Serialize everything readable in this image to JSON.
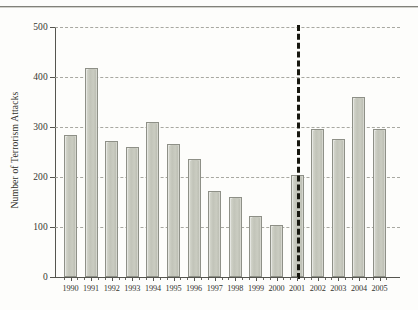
{
  "figure": {
    "background_color": "#fdfdfb",
    "has_top_rule": true,
    "bar_fill_color": "#c6c8bd",
    "bar_border_color": "#8e9087",
    "gridline_color": "#9a9a92",
    "axis_color": "#55554f",
    "divider_color": "#17170f"
  },
  "chart_data": {
    "type": "bar",
    "title": "",
    "xlabel": "",
    "ylabel": "Number of Terrorism Attacks",
    "ylim": [
      0,
      500
    ],
    "yticks": [
      0,
      100,
      200,
      300,
      400,
      500
    ],
    "ytick_labels": [
      "0",
      "100",
      "200",
      "300",
      "400",
      "500"
    ],
    "grid": true,
    "grid_axis": "y",
    "grid_style": "dashed",
    "legend": null,
    "categories": [
      "1990",
      "1991",
      "1992",
      "1993",
      "1994",
      "1995",
      "1996",
      "1997",
      "1998",
      "1999",
      "2000",
      "2001",
      "2002",
      "2003",
      "2004",
      "2005"
    ],
    "values": [
      285,
      418,
      273,
      261,
      311,
      266,
      237,
      172,
      160,
      122,
      105,
      205,
      297,
      277,
      360,
      297
    ],
    "annotations": [
      {
        "type": "vline",
        "label": "2001 divider",
        "at_category": "2001",
        "style": "thick-dashed",
        "color": "#17170f"
      }
    ]
  }
}
